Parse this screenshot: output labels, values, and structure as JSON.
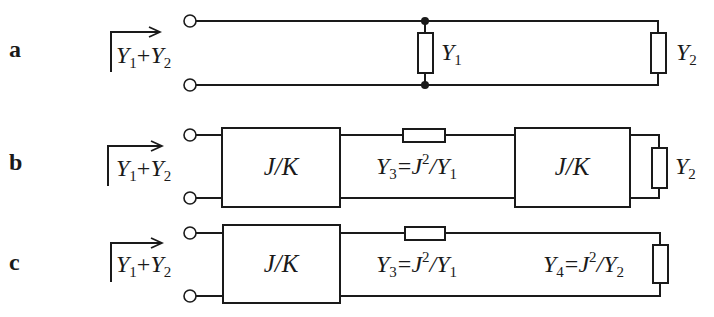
{
  "figure": {
    "type": "circuit-diagram",
    "rows": [
      {
        "id": "a",
        "label": "a",
        "input_admittance": {
          "base1": "Y",
          "sub1": "1",
          "op": "+",
          "base2": "Y",
          "sub2": "2"
        },
        "components": [
          {
            "kind": "shunt-admittance",
            "base": "Y",
            "sub": "1"
          },
          {
            "kind": "load-admittance",
            "base": "Y",
            "sub": "2"
          }
        ]
      },
      {
        "id": "b",
        "label": "b",
        "input_admittance": {
          "base1": "Y",
          "sub1": "1",
          "op": "+",
          "base2": "Y",
          "sub2": "2"
        },
        "inverter1_label": "J/K",
        "inverter2_label": "J/K",
        "series": {
          "base": "Y",
          "sub": "3",
          "eq": "=",
          "rhs_base": "J",
          "rhs_sup": "2",
          "rhs_div": "/",
          "rhs_den": "Y",
          "rhs_den_sub": "1"
        },
        "load": {
          "base": "Y",
          "sub": "2"
        }
      },
      {
        "id": "c",
        "label": "c",
        "input_admittance": {
          "base1": "Y",
          "sub1": "1",
          "op": "+",
          "base2": "Y",
          "sub2": "2"
        },
        "inverter1_label": "J/K",
        "series": {
          "base": "Y",
          "sub": "3",
          "eq": "=",
          "rhs_base": "J",
          "rhs_sup": "2",
          "rhs_div": "/",
          "rhs_den": "Y",
          "rhs_den_sub": "1"
        },
        "load": {
          "base": "Y",
          "sub": "4",
          "eq": "=",
          "rhs_base": "J",
          "rhs_sup": "2",
          "rhs_div": "/",
          "rhs_den": "Y",
          "rhs_den_sub": "2"
        }
      }
    ]
  }
}
